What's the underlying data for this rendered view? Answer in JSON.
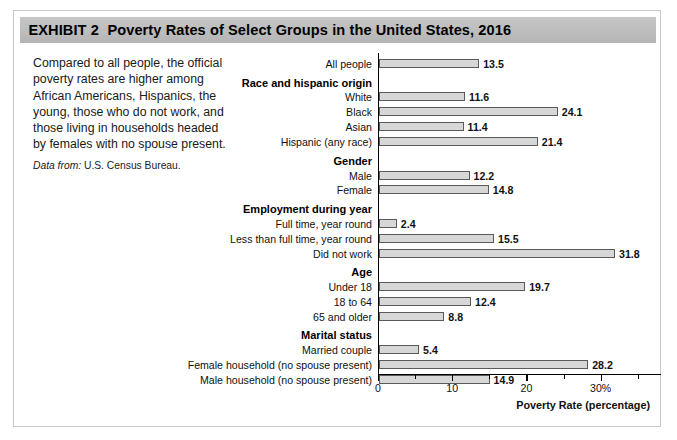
{
  "header": {
    "exhibit_label": "EXHIBIT 2",
    "title": "Poverty Rates of Select Groups in the United States, 2016"
  },
  "caption": {
    "body": "Compared to all people, the official poverty rates are higher among African Americans, Hispanics, the young, those who do not work, and those living in households headed by females with no spouse present.",
    "source_label": "Data from:",
    "source_value": "U.S. Census Bureau."
  },
  "chart_data": {
    "type": "bar",
    "orientation": "horizontal",
    "title": "Poverty Rates of Select Groups in the United States, 2016",
    "xlabel": "Poverty Rate (percentage)",
    "ylabel": "",
    "xlim": [
      0,
      38
    ],
    "grid": false,
    "legend": null,
    "xticks": [
      {
        "value": 0,
        "label": "0",
        "major": true
      },
      {
        "value": 5,
        "label": "",
        "major": false
      },
      {
        "value": 10,
        "label": "10",
        "major": true
      },
      {
        "value": 15,
        "label": "",
        "major": false
      },
      {
        "value": 20,
        "label": "20",
        "major": true
      },
      {
        "value": 25,
        "label": "",
        "major": false
      },
      {
        "value": 30,
        "label": "30%",
        "major": true
      },
      {
        "value": 35,
        "label": "",
        "major": false
      }
    ],
    "categories": [
      "All people",
      "Race and hispanic origin",
      "White",
      "Black",
      "Asian",
      "Hispanic (any race)",
      "Gender",
      "Male",
      "Female",
      "Employment during year",
      "Full time, year round",
      "Less than full time, year round",
      "Did not work",
      "Age",
      "Under 18",
      "18 to 64",
      "65 and older",
      "Marital status",
      "Married couple",
      "Female household (no spouse present)",
      "Male household (no spouse present)"
    ],
    "values": [
      13.5,
      null,
      11.6,
      24.1,
      11.4,
      21.4,
      null,
      12.2,
      14.8,
      null,
      2.4,
      15.5,
      31.8,
      null,
      19.7,
      12.4,
      8.8,
      null,
      5.4,
      28.2,
      14.9
    ],
    "rows": [
      {
        "label": "All people",
        "value": 13.5,
        "value_text": "13.5",
        "group": false,
        "spacer_before": false
      },
      {
        "label": "Race and hispanic origin",
        "value": null,
        "value_text": "",
        "group": true,
        "spacer_before": true
      },
      {
        "label": "White",
        "value": 11.6,
        "value_text": "11.6",
        "group": false,
        "spacer_before": false
      },
      {
        "label": "Black",
        "value": 24.1,
        "value_text": "24.1",
        "group": false,
        "spacer_before": false
      },
      {
        "label": "Asian",
        "value": 11.4,
        "value_text": "11.4",
        "group": false,
        "spacer_before": false
      },
      {
        "label": "Hispanic (any race)",
        "value": 21.4,
        "value_text": "21.4",
        "group": false,
        "spacer_before": false
      },
      {
        "label": "Gender",
        "value": null,
        "value_text": "",
        "group": true,
        "spacer_before": true
      },
      {
        "label": "Male",
        "value": 12.2,
        "value_text": "12.2",
        "group": false,
        "spacer_before": false
      },
      {
        "label": "Female",
        "value": 14.8,
        "value_text": "14.8",
        "group": false,
        "spacer_before": false
      },
      {
        "label": "Employment during year",
        "value": null,
        "value_text": "",
        "group": true,
        "spacer_before": true
      },
      {
        "label": "Full time, year round",
        "value": 2.4,
        "value_text": "2.4",
        "group": false,
        "spacer_before": false
      },
      {
        "label": "Less than full time, year round",
        "value": 15.5,
        "value_text": "15.5",
        "group": false,
        "spacer_before": false
      },
      {
        "label": "Did not work",
        "value": 31.8,
        "value_text": "31.8",
        "group": false,
        "spacer_before": false
      },
      {
        "label": "Age",
        "value": null,
        "value_text": "",
        "group": true,
        "spacer_before": true
      },
      {
        "label": "Under 18",
        "value": 19.7,
        "value_text": "19.7",
        "group": false,
        "spacer_before": false
      },
      {
        "label": "18 to 64",
        "value": 12.4,
        "value_text": "12.4",
        "group": false,
        "spacer_before": false
      },
      {
        "label": "65 and older",
        "value": 8.8,
        "value_text": "8.8",
        "group": false,
        "spacer_before": false
      },
      {
        "label": "Marital status",
        "value": null,
        "value_text": "",
        "group": true,
        "spacer_before": true
      },
      {
        "label": "Married couple",
        "value": 5.4,
        "value_text": "5.4",
        "group": false,
        "spacer_before": false
      },
      {
        "label": "Female household (no spouse present)",
        "value": 28.2,
        "value_text": "28.2",
        "group": false,
        "spacer_before": false
      },
      {
        "label": "Male household (no spouse present)",
        "value": 14.9,
        "value_text": "14.9",
        "group": false,
        "spacer_before": false
      }
    ]
  },
  "colors": {
    "header_band": "#bdbdbd",
    "bar_fill": "#d7d7d7",
    "bar_stroke": "#5a5a5a",
    "figure_border": "#c9c9c9",
    "text": "#111111"
  }
}
